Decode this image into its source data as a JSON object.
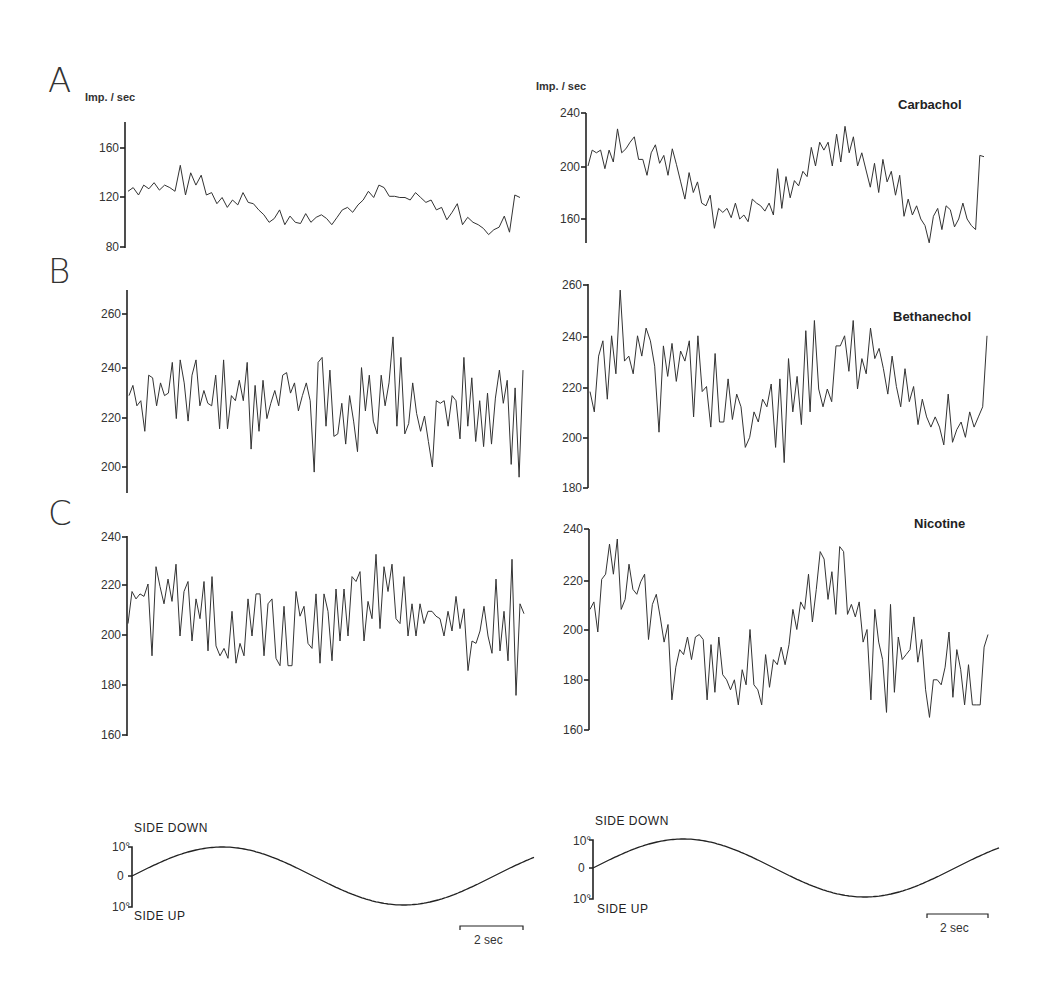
{
  "figure": {
    "panel_labels": [
      "A",
      "B",
      "C"
    ],
    "unit_label": "Imp. / sec",
    "drugs": [
      "Carbachol",
      "Bethanechol",
      "Nicotine"
    ],
    "stimulus": {
      "top_label": "SIDE DOWN",
      "bottom_label": "SIDE UP",
      "ticks": [
        "10°",
        "0",
        "10°"
      ],
      "scale_bar": "2 sec"
    }
  },
  "chart_data": [
    {
      "type": "line",
      "panel": "A",
      "side": "left",
      "title": "",
      "ylabel": "Imp. / sec",
      "yticks": [
        80,
        120,
        160
      ],
      "ylim": [
        78,
        180
      ],
      "description": "Firing rate modulated sinusoidally with tilt, ~125 imp/s at start, trough ~100, peak ~130, ends ~120",
      "values": [
        125,
        128,
        122,
        130,
        127,
        132,
        126,
        130,
        128,
        125,
        146,
        122,
        140,
        130,
        138,
        122,
        124,
        115,
        120,
        112,
        118,
        114,
        124,
        116,
        115,
        110,
        106,
        100,
        103,
        110,
        98,
        105,
        100,
        99,
        107,
        100,
        104,
        106,
        103,
        98,
        104,
        110,
        112,
        108,
        114,
        118,
        125,
        120,
        130,
        128,
        121,
        121,
        120,
        120,
        118,
        124,
        120,
        116,
        118,
        110,
        112,
        102,
        108,
        115,
        98,
        104,
        100,
        98,
        95,
        90,
        94,
        96,
        105,
        92,
        122,
        120
      ]
    },
    {
      "type": "line",
      "panel": "A",
      "side": "right",
      "title": "Carbachol",
      "ylabel": "Imp. / sec",
      "yticks": [
        160,
        200,
        240
      ],
      "ylim": [
        145,
        240
      ],
      "values": [
        200,
        212,
        210,
        212,
        198,
        212,
        203,
        228,
        210,
        213,
        218,
        222,
        205,
        205,
        193,
        210,
        216,
        202,
        208,
        193,
        213,
        201,
        188,
        175,
        195,
        180,
        188,
        172,
        170,
        178,
        153,
        168,
        165,
        168,
        161,
        172,
        160,
        163,
        158,
        175,
        172,
        170,
        166,
        172,
        163,
        198,
        168,
        192,
        176,
        189,
        185,
        196,
        192,
        214,
        200,
        218,
        212,
        218,
        200,
        224,
        203,
        230,
        210,
        222,
        200,
        210,
        197,
        184,
        202,
        180,
        205,
        188,
        196,
        178,
        193,
        162,
        175,
        163,
        170,
        160,
        155,
        142,
        162,
        168,
        152,
        170,
        167,
        154,
        160,
        172,
        160,
        155,
        152,
        208,
        207
      ]
    },
    {
      "type": "line",
      "panel": "B",
      "side": "left",
      "title": "",
      "yticks": [
        200,
        220,
        240,
        260
      ],
      "ylim": [
        195,
        268
      ],
      "values": [
        228,
        232,
        224,
        226,
        214,
        236,
        235,
        224,
        233,
        228,
        229,
        241,
        219,
        242,
        233,
        218,
        236,
        242,
        224,
        230,
        225,
        224,
        236,
        215,
        242,
        215,
        228,
        226,
        234,
        226,
        241,
        207,
        232,
        214,
        234,
        219,
        225,
        230,
        224,
        236,
        237,
        229,
        233,
        222,
        228,
        233,
        226,
        198,
        241,
        243,
        216,
        238,
        212,
        213,
        225,
        209,
        228,
        218,
        206,
        239,
        222,
        236,
        218,
        213,
        236,
        224,
        233,
        251,
        216,
        243,
        213,
        217,
        233,
        221,
        214,
        220,
        210,
        200,
        226,
        225,
        226,
        216,
        228,
        226,
        211,
        243,
        216,
        235,
        210,
        226,
        208,
        229,
        209,
        227,
        238,
        225,
        234,
        201,
        231,
        196,
        238
      ]
    },
    {
      "type": "line",
      "panel": "B",
      "side": "right",
      "title": "Bethanechol",
      "yticks": [
        180,
        200,
        220,
        240,
        260
      ],
      "ylim": [
        180,
        260
      ],
      "values": [
        218,
        210,
        232,
        238,
        215,
        240,
        225,
        258,
        230,
        232,
        225,
        240,
        232,
        243,
        238,
        228,
        202,
        236,
        224,
        237,
        222,
        234,
        230,
        238,
        208,
        240,
        218,
        220,
        204,
        233,
        206,
        206,
        223,
        207,
        217,
        212,
        196,
        200,
        210,
        206,
        215,
        212,
        221,
        196,
        223,
        190,
        231,
        210,
        224,
        205,
        242,
        210,
        246,
        219,
        212,
        219,
        214,
        236,
        236,
        240,
        226,
        246,
        219,
        231,
        225,
        243,
        231,
        235,
        227,
        217,
        232,
        220,
        212,
        227,
        214,
        220,
        205,
        215,
        208,
        204,
        208,
        204,
        197,
        217,
        198,
        203,
        206,
        200,
        210,
        204,
        208,
        212,
        240
      ]
    },
    {
      "type": "line",
      "panel": "C",
      "side": "left",
      "title": "",
      "yticks": [
        160,
        180,
        200,
        240
      ],
      "ylim": [
        160,
        240
      ],
      "values": [
        205,
        218,
        215,
        217,
        216,
        221,
        192,
        228,
        220,
        213,
        223,
        214,
        229,
        200,
        218,
        222,
        198,
        215,
        207,
        222,
        194,
        224,
        196,
        192,
        195,
        191,
        210,
        189,
        197,
        192,
        215,
        200,
        217,
        217,
        192,
        213,
        215,
        191,
        188,
        212,
        188,
        188,
        218,
        208,
        212,
        197,
        195,
        217,
        189,
        217,
        210,
        190,
        219,
        198,
        219,
        200,
        224,
        222,
        226,
        198,
        214,
        207,
        233,
        203,
        228,
        218,
        229,
        207,
        205,
        224,
        200,
        213,
        200,
        213,
        205,
        210,
        210,
        208,
        207,
        200,
        210,
        202,
        216,
        203,
        211,
        186,
        198,
        197,
        202,
        212,
        200,
        193,
        223,
        194,
        210,
        190,
        231,
        176,
        213,
        209
      ]
    },
    {
      "type": "line",
      "panel": "C",
      "side": "right",
      "title": "Nicotine",
      "yticks": [
        160,
        180,
        200,
        220,
        240
      ],
      "ylim": [
        160,
        240
      ],
      "values": [
        208,
        211,
        199,
        220,
        222,
        234,
        222,
        236,
        208,
        212,
        226,
        216,
        214,
        219,
        222,
        196,
        210,
        214,
        205,
        195,
        202,
        172,
        185,
        192,
        190,
        197,
        188,
        197,
        198,
        196,
        172,
        194,
        175,
        197,
        182,
        180,
        176,
        180,
        170,
        184,
        178,
        200,
        178,
        176,
        170,
        190,
        177,
        188,
        186,
        193,
        186,
        194,
        208,
        200,
        211,
        208,
        222,
        203,
        216,
        231,
        228,
        212,
        223,
        206,
        233,
        231,
        206,
        210,
        205,
        211,
        195,
        200,
        172,
        208,
        195,
        188,
        167,
        210,
        175,
        197,
        188,
        190,
        192,
        205,
        187,
        196,
        176,
        165,
        180,
        180,
        178,
        185,
        199,
        173,
        192,
        184,
        170,
        186,
        170,
        170,
        170,
        193,
        198
      ]
    },
    {
      "type": "line",
      "panel": "stimulus",
      "side": "left",
      "title": "Tilt stimulus",
      "ylabel": "deg",
      "yticks": [
        "10° SIDE DOWN",
        "0",
        "10° SIDE UP"
      ],
      "description": "Sinusoidal tilt ±10°, ~2.3 cycles, scale bar 2 sec (period ≈ 4.5 s)"
    },
    {
      "type": "line",
      "panel": "stimulus",
      "side": "right",
      "title": "Tilt stimulus",
      "ylabel": "deg",
      "yticks": [
        "10° SIDE DOWN",
        "0",
        "10° SIDE UP"
      ],
      "description": "Sinusoidal tilt ±10°, scale bar 2 sec"
    }
  ]
}
